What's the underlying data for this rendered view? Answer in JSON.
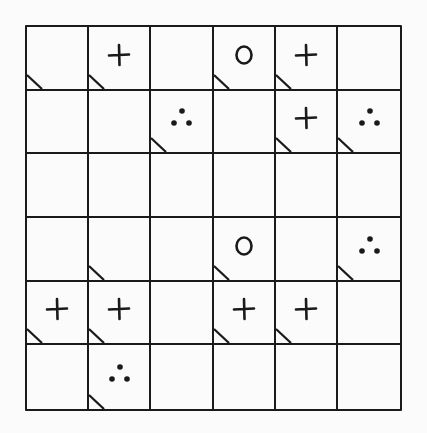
{
  "grid": {
    "rows": 6,
    "cols": 6,
    "line_color": "#1a1a1a",
    "background": "#fbfbfb",
    "cells": [
      [
        {
          "symbol": "",
          "corner": true
        },
        {
          "symbol": "plus",
          "corner": true
        },
        {
          "symbol": "",
          "corner": false
        },
        {
          "symbol": "circle",
          "corner": true
        },
        {
          "symbol": "plus",
          "corner": true
        },
        {
          "symbol": "",
          "corner": false
        }
      ],
      [
        {
          "symbol": "",
          "corner": false
        },
        {
          "symbol": "",
          "corner": false
        },
        {
          "symbol": "dots",
          "corner": true
        },
        {
          "symbol": "",
          "corner": false
        },
        {
          "symbol": "plus",
          "corner": true
        },
        {
          "symbol": "dots",
          "corner": true
        }
      ],
      [
        {
          "symbol": "",
          "corner": false
        },
        {
          "symbol": "",
          "corner": false
        },
        {
          "symbol": "",
          "corner": false
        },
        {
          "symbol": "",
          "corner": false
        },
        {
          "symbol": "",
          "corner": false
        },
        {
          "symbol": "",
          "corner": false
        }
      ],
      [
        {
          "symbol": "",
          "corner": false
        },
        {
          "symbol": "",
          "corner": true
        },
        {
          "symbol": "",
          "corner": false
        },
        {
          "symbol": "circle",
          "corner": true
        },
        {
          "symbol": "",
          "corner": false
        },
        {
          "symbol": "dots",
          "corner": true
        }
      ],
      [
        {
          "symbol": "plus",
          "corner": true
        },
        {
          "symbol": "plus",
          "corner": true
        },
        {
          "symbol": "",
          "corner": false
        },
        {
          "symbol": "plus",
          "corner": true
        },
        {
          "symbol": "plus",
          "corner": true
        },
        {
          "symbol": "",
          "corner": false
        }
      ],
      [
        {
          "symbol": "",
          "corner": false
        },
        {
          "symbol": "dots",
          "corner": true
        },
        {
          "symbol": "",
          "corner": false
        },
        {
          "symbol": "",
          "corner": false
        },
        {
          "symbol": "",
          "corner": false
        },
        {
          "symbol": "",
          "corner": false
        }
      ]
    ]
  },
  "legend_icons": {
    "plus": "plus-icon",
    "circle": "circle-icon",
    "dots": "three-dots-icon",
    "corner": "corner-triangle-icon"
  }
}
